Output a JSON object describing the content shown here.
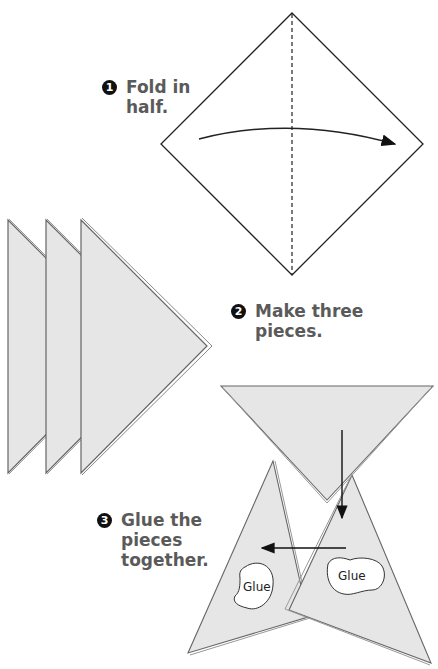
{
  "steps": [
    {
      "number": "1",
      "text_line1": "Fold in",
      "text_line2": "half."
    },
    {
      "number": "2",
      "text_line1": "Make three",
      "text_line2": "pieces."
    },
    {
      "number": "3",
      "text_line1": "Glue the",
      "text_line2": "pieces",
      "text_line3": "together."
    }
  ],
  "glue_labels": [
    "Glue",
    "Glue"
  ],
  "colors": {
    "paper_fill": "#e6e6e6",
    "outline": "#555555",
    "text": "#5a5a5a",
    "badge": "#111111"
  }
}
